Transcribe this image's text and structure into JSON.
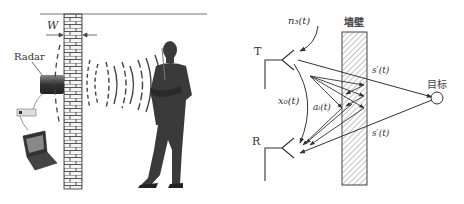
{
  "left_panel": {
    "wall_width_label": "W",
    "radar_label": "Radar",
    "elements": [
      "brick-wall",
      "radar-device",
      "laptop",
      "sensor-box",
      "person",
      "radar-waves"
    ]
  },
  "right_panel": {
    "wall_label": "墙壁",
    "target_label": "目标",
    "transmitter_label": "T",
    "receiver_label": "R",
    "signals": {
      "noise": "n₃(t)",
      "direct_coupling": "x₀(t)",
      "wall_reflection": "aᵢ(t)",
      "target_forward": "s′(t)",
      "target_return": "s′(t)"
    }
  },
  "colors": {
    "line": "#333333",
    "hatch": "#888888",
    "brick": "#555555",
    "person": "#3a3a3a"
  }
}
